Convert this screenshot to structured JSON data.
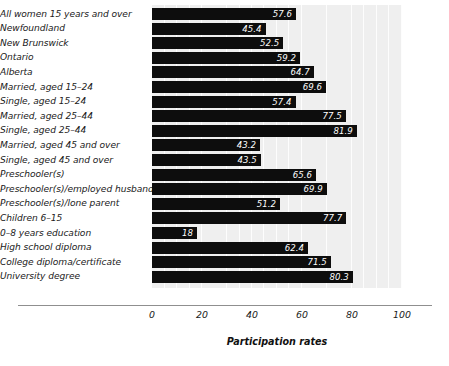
{
  "chart_data": {
    "type": "bar",
    "orientation": "horizontal",
    "title": "",
    "xlabel": "Participation rates",
    "ylabel": "",
    "xlim": [
      0,
      100
    ],
    "xticks": [
      0,
      20,
      40,
      60,
      80,
      100
    ],
    "xtick_labels": [
      "0",
      "20",
      "40",
      "60",
      "80",
      "100"
    ],
    "grid": true,
    "grid_axis": "x",
    "legend": null,
    "bar_color": "#0d0d0d",
    "plot_background": "#efefef",
    "value_label_color": "#ffffff",
    "categories": [
      "All women 15 years and over",
      "Newfoundland",
      "New Brunswick",
      "Ontario",
      "Alberta",
      "Married, aged 15–24",
      "Single, aged 15–24",
      "Married, aged 25–44",
      "Single, aged 25–44",
      "Married, aged 45 and over",
      "Single, aged 45 and over",
      "Preschooler(s)",
      "Preschooler(s)/employed husband",
      "Preschooler(s)/lone parent",
      "Children 6–15",
      "0–8 years education",
      "High school diploma",
      "College diploma/certificate",
      "University degree"
    ],
    "values": [
      57.6,
      45.4,
      52.5,
      59.2,
      64.7,
      69.6,
      57.4,
      77.5,
      81.9,
      43.2,
      43.5,
      65.6,
      69.9,
      51.2,
      77.7,
      18,
      62.4,
      71.5,
      80.3
    ],
    "value_labels": [
      "57.6",
      "45.4",
      "52.5",
      "59.2",
      "64.7",
      "69.6",
      "57.4",
      "77.5",
      "81.9",
      "43.2",
      "43.5",
      "65.6",
      "69.9",
      "51.2",
      "77.7",
      "18",
      "62.4",
      "71.5",
      "80.3"
    ]
  }
}
